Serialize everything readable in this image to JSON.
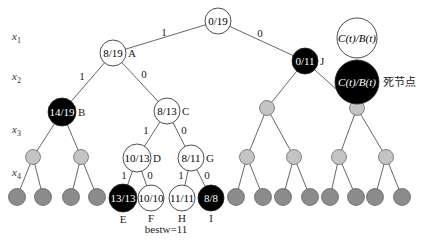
{
  "axis_labels": [
    {
      "var": "x",
      "sub": "1",
      "x": 12,
      "y": 40
    },
    {
      "var": "x",
      "sub": "2",
      "x": 12,
      "y": 80
    },
    {
      "var": "x",
      "sub": "3",
      "x": 12,
      "y": 133
    },
    {
      "var": "x",
      "sub": "4",
      "x": 12,
      "y": 176
    }
  ],
  "nodes": [
    {
      "id": "root",
      "label": "0/19",
      "name": "",
      "x": 218,
      "y": 21,
      "r": 13,
      "fill": "#ffffff",
      "text": "#000000"
    },
    {
      "id": "A",
      "label": "8/19",
      "name": "A",
      "x": 113,
      "y": 53,
      "r": 13,
      "fill": "#ffffff",
      "text": "#000000"
    },
    {
      "id": "J",
      "label": "0/11",
      "name": "J",
      "x": 305,
      "y": 61,
      "r": 13,
      "fill": "#000000",
      "text": "#ffffff"
    },
    {
      "id": "B",
      "label": "14/19",
      "name": "B",
      "x": 62,
      "y": 112,
      "r": 14,
      "fill": "#000000",
      "text": "#ffffff"
    },
    {
      "id": "C",
      "label": "8/13",
      "name": "C",
      "x": 167,
      "y": 111,
      "r": 13,
      "fill": "#ffffff",
      "text": "#000000"
    },
    {
      "id": "D",
      "label": "10/13",
      "name": "D",
      "x": 137,
      "y": 158,
      "r": 14,
      "fill": "#ffffff",
      "text": "#000000"
    },
    {
      "id": "G",
      "label": "8/11",
      "name": "G",
      "x": 191,
      "y": 158,
      "r": 13,
      "fill": "#ffffff",
      "text": "#000000"
    },
    {
      "id": "E",
      "label": "13/13",
      "name": "E",
      "x": 123,
      "y": 198,
      "r": 14,
      "fill": "#000000",
      "text": "#ffffff"
    },
    {
      "id": "F",
      "label": "10/10",
      "name": "F",
      "x": 151,
      "y": 198,
      "r": 13,
      "fill": "#ffffff",
      "text": "#000000"
    },
    {
      "id": "H",
      "label": "11/11",
      "name": "H",
      "x": 182,
      "y": 198,
      "r": 13,
      "fill": "#ffffff",
      "text": "#000000"
    },
    {
      "id": "I",
      "label": "8/8",
      "name": "I",
      "x": 211,
      "y": 198,
      "r": 13,
      "fill": "#000000",
      "text": "#ffffff"
    }
  ],
  "node_name_positions": {
    "A": "right",
    "J": "right",
    "B": "right",
    "C": "right",
    "D": "right",
    "G": "right",
    "E": "below",
    "F": "below",
    "H": "below",
    "I": "below"
  },
  "gray_nodes_level3": [
    {
      "x": 33,
      "y": 157
    },
    {
      "x": 81,
      "y": 157
    },
    {
      "x": 267,
      "y": 108
    },
    {
      "x": 357,
      "y": 108
    }
  ],
  "gray_nodes_level4": [
    {
      "x": 247,
      "y": 157
    },
    {
      "x": 294,
      "y": 157
    },
    {
      "x": 339,
      "y": 157
    },
    {
      "x": 386,
      "y": 157
    }
  ],
  "leaf_nodes": [
    {
      "x": 17,
      "y": 197
    },
    {
      "x": 43,
      "y": 197
    },
    {
      "x": 71,
      "y": 197
    },
    {
      "x": 97,
      "y": 197
    },
    {
      "x": 236,
      "y": 197
    },
    {
      "x": 263,
      "y": 197
    },
    {
      "x": 283,
      "y": 197
    },
    {
      "x": 310,
      "y": 197
    },
    {
      "x": 330,
      "y": 197
    },
    {
      "x": 356,
      "y": 197
    },
    {
      "x": 375,
      "y": 197
    },
    {
      "x": 402,
      "y": 197
    }
  ],
  "edges": [
    {
      "from": [
        218,
        21
      ],
      "to": [
        113,
        53
      ],
      "label": "1",
      "lx": 164,
      "ly": 36
    },
    {
      "from": [
        218,
        21
      ],
      "to": [
        305,
        61
      ],
      "label": "0",
      "lx": 260,
      "ly": 37
    },
    {
      "from": [
        113,
        53
      ],
      "to": [
        62,
        112
      ],
      "label": "1",
      "lx": 82,
      "ly": 80
    },
    {
      "from": [
        113,
        53
      ],
      "to": [
        167,
        111
      ],
      "label": "0",
      "lx": 144,
      "ly": 78
    },
    {
      "from": [
        167,
        111
      ],
      "to": [
        137,
        158
      ],
      "label": "1",
      "lx": 146,
      "ly": 134
    },
    {
      "from": [
        167,
        111
      ],
      "to": [
        191,
        158
      ],
      "label": "0",
      "lx": 184,
      "ly": 134
    },
    {
      "from": [
        137,
        158
      ],
      "to": [
        123,
        198
      ],
      "label": "1",
      "lx": 124,
      "ly": 179
    },
    {
      "from": [
        137,
        158
      ],
      "to": [
        151,
        198
      ],
      "label": "0",
      "lx": 150,
      "ly": 179
    },
    {
      "from": [
        191,
        158
      ],
      "to": [
        182,
        198
      ],
      "label": "1",
      "lx": 181,
      "ly": 179
    },
    {
      "from": [
        191,
        158
      ],
      "to": [
        211,
        198
      ],
      "label": "0",
      "lx": 207,
      "ly": 179
    },
    {
      "from": [
        62,
        112
      ],
      "to": [
        33,
        157
      ]
    },
    {
      "from": [
        62,
        112
      ],
      "to": [
        81,
        157
      ]
    },
    {
      "from": [
        33,
        157
      ],
      "to": [
        17,
        197
      ]
    },
    {
      "from": [
        33,
        157
      ],
      "to": [
        43,
        197
      ]
    },
    {
      "from": [
        81,
        157
      ],
      "to": [
        71,
        197
      ]
    },
    {
      "from": [
        81,
        157
      ],
      "to": [
        97,
        197
      ]
    },
    {
      "from": [
        305,
        61
      ],
      "to": [
        267,
        108
      ]
    },
    {
      "from": [
        305,
        61
      ],
      "to": [
        357,
        108
      ]
    },
    {
      "from": [
        267,
        108
      ],
      "to": [
        247,
        157
      ]
    },
    {
      "from": [
        267,
        108
      ],
      "to": [
        294,
        157
      ]
    },
    {
      "from": [
        357,
        108
      ],
      "to": [
        339,
        157
      ]
    },
    {
      "from": [
        357,
        108
      ],
      "to": [
        386,
        157
      ]
    },
    {
      "from": [
        247,
        157
      ],
      "to": [
        236,
        197
      ]
    },
    {
      "from": [
        247,
        157
      ],
      "to": [
        263,
        197
      ]
    },
    {
      "from": [
        294,
        157
      ],
      "to": [
        283,
        197
      ]
    },
    {
      "from": [
        294,
        157
      ],
      "to": [
        310,
        197
      ]
    },
    {
      "from": [
        339,
        157
      ],
      "to": [
        330,
        197
      ]
    },
    {
      "from": [
        339,
        157
      ],
      "to": [
        356,
        197
      ]
    },
    {
      "from": [
        386,
        157
      ],
      "to": [
        375,
        197
      ]
    },
    {
      "from": [
        386,
        157
      ],
      "to": [
        402,
        197
      ]
    }
  ],
  "legend": {
    "live": {
      "label": "C(t)/B(t)",
      "x": 357,
      "y": 38,
      "r": 20,
      "fill": "#ffffff",
      "text": "#000000"
    },
    "dead": {
      "label": "C(t)/B(t)",
      "x": 357,
      "y": 82,
      "r": 22,
      "fill": "#000000",
      "text": "#ffffff",
      "caption": "死节点"
    }
  },
  "bestw_label": "bestw=11",
  "colors": {
    "line": "#555555",
    "gray_level3": "#c4c4c4",
    "gray_leaf": "#8c8c8c",
    "stroke": "#444444"
  }
}
